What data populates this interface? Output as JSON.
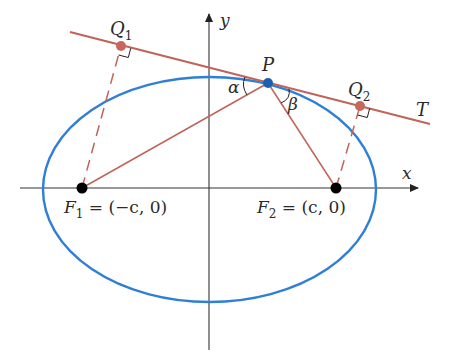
{
  "diagram": {
    "colors": {
      "ellipse": "#2f7fd6",
      "tangent": "#c0645a",
      "focal_lines": "#c0645a",
      "point_P": "#1f5fb0",
      "points_Q": "#c8675c",
      "foci": "#000000",
      "axes": "#333333"
    },
    "axes": {
      "x_label": "x",
      "y_label": "y"
    },
    "points": {
      "P": {
        "label": "P"
      },
      "Q1": {
        "label_main": "Q",
        "label_sub": "1"
      },
      "Q2": {
        "label_main": "Q",
        "label_sub": "2"
      },
      "F1": {
        "label_main": "F",
        "label_sub": "1",
        "label_rest": " = (−c, 0)"
      },
      "F2": {
        "label_main": "F",
        "label_sub": "2",
        "label_rest": " = (c, 0)"
      }
    },
    "tangent": {
      "label": "T"
    },
    "angles": {
      "alpha": "α",
      "beta": "β"
    }
  }
}
